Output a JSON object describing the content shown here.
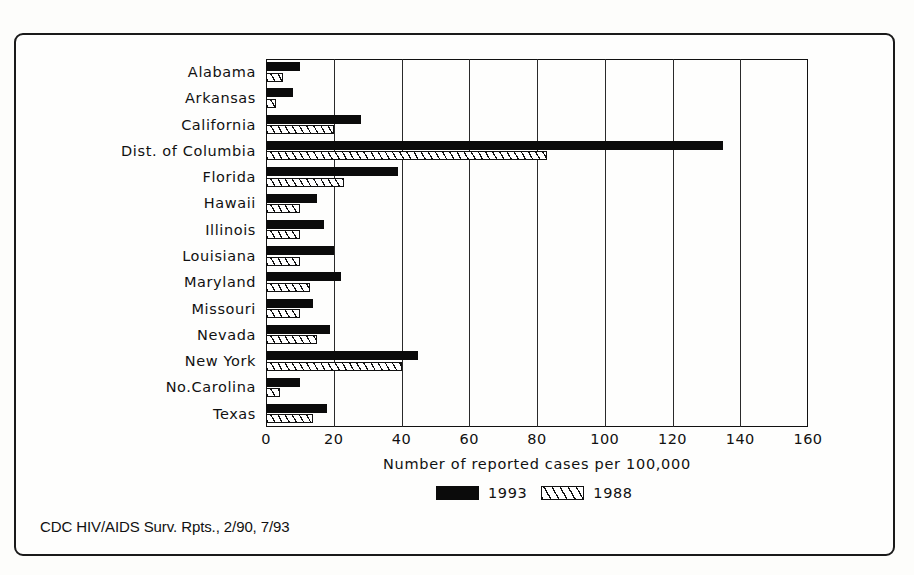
{
  "chart_data": {
    "type": "bar",
    "orientation": "horizontal",
    "title": "",
    "xlabel": "Number of reported cases per 100,000",
    "ylabel": "",
    "xlim": [
      0,
      160
    ],
    "xticks": [
      0,
      20,
      40,
      60,
      80,
      100,
      120,
      140,
      160
    ],
    "grid": "vertical",
    "legend_position": "bottom",
    "categories": [
      "Alabama",
      "Arkansas",
      "California",
      "Dist. of Columbia",
      "Florida",
      "Hawaii",
      "Illinois",
      "Louisiana",
      "Maryland",
      "Missouri",
      "Nevada",
      "New York",
      "No.Carolina",
      "Texas"
    ],
    "series": [
      {
        "name": "1993",
        "color": "#0b0b0b",
        "fill": "solid",
        "values": [
          10,
          8,
          28,
          135,
          39,
          15,
          17,
          20,
          22,
          14,
          19,
          45,
          10,
          18
        ]
      },
      {
        "name": "1988",
        "color": "#ffffff",
        "fill": "diagonal-hatch",
        "values": [
          5,
          3,
          20,
          83,
          23,
          10,
          10,
          10,
          13,
          10,
          15,
          40,
          4,
          14
        ]
      }
    ],
    "annotations": [
      "CDC HIV/AIDS Surv. Rpts., 2/90, 7/93"
    ]
  },
  "axis": {
    "x_title": "Number of reported cases per 100,000",
    "tick_labels": [
      "0",
      "20",
      "40",
      "60",
      "80",
      "100",
      "120",
      "140",
      "160"
    ]
  },
  "legend": {
    "items": [
      {
        "label": "1993",
        "style": "solid"
      },
      {
        "label": "1988",
        "style": "hatch"
      }
    ]
  },
  "source": {
    "text": "CDC HIV/AIDS Surv. Rpts., 2/90, 7/93"
  }
}
